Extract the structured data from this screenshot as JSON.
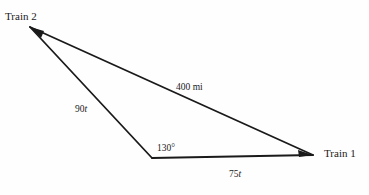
{
  "figure": {
    "type": "triangle-diagram",
    "width": 369,
    "height": 195,
    "background_color": "#fefefe",
    "stroke_color": "#1a1a1a",
    "text_color": "#1a1a1a"
  },
  "vertices": {
    "train2": {
      "label": "Train 2",
      "x": 30,
      "y": 27
    },
    "corner": {
      "label": "",
      "x": 152,
      "y": 158
    },
    "train1": {
      "label": "Train 1",
      "x": 313,
      "y": 155
    }
  },
  "sides": {
    "hypotenuse": {
      "label": "400 mi",
      "from": "train2",
      "to": "train1"
    },
    "left": {
      "label_number": "90",
      "label_variable": "t",
      "from": "train2",
      "to": "corner"
    },
    "bottom": {
      "label_number": "75",
      "label_variable": "t",
      "from": "corner",
      "to": "train1"
    }
  },
  "angles": {
    "corner_angle": {
      "label": "130°",
      "at": "corner"
    }
  }
}
